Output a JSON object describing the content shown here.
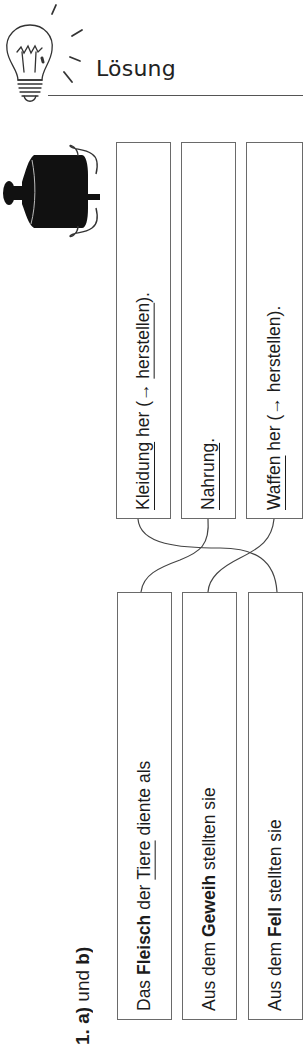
{
  "header": {
    "title": "Lösung",
    "icon": "lightbulb-icon"
  },
  "illustration": {
    "icon": "cooking-pot-icon"
  },
  "task": {
    "label_number": "1.",
    "label_a": "a)",
    "label_und": "und",
    "label_b": "b)"
  },
  "endings": [
    {
      "parts": [
        {
          "text": "Kleidung",
          "style": "underline"
        },
        {
          "text": " her (→ ",
          "style": "normal"
        },
        {
          "text": "herstellen",
          "style": "underline"
        },
        {
          "text": ").",
          "style": "normal"
        }
      ]
    },
    {
      "parts": [
        {
          "text": "Nahrung",
          "style": "underline"
        },
        {
          "text": ".",
          "style": "normal"
        }
      ]
    },
    {
      "parts": [
        {
          "text": "Waffen",
          "style": "underline"
        },
        {
          "text": " her (→ herstellen).",
          "style": "normal"
        }
      ]
    }
  ],
  "beginnings": [
    {
      "parts": [
        {
          "text": "Das ",
          "style": "normal"
        },
        {
          "text": "Fleisch",
          "style": "bold"
        },
        {
          "text": " der ",
          "style": "normal"
        },
        {
          "text": "Tiere",
          "style": "underline"
        },
        {
          "text": " diente als",
          "style": "normal"
        }
      ]
    },
    {
      "parts": [
        {
          "text": "Aus dem ",
          "style": "normal"
        },
        {
          "text": "Geweih",
          "style": "bold"
        },
        {
          "text": " stellten sie",
          "style": "normal"
        }
      ]
    },
    {
      "parts": [
        {
          "text": "Aus dem ",
          "style": "normal"
        },
        {
          "text": "Fell",
          "style": "bold"
        },
        {
          "text": " stellten sie",
          "style": "normal"
        }
      ]
    }
  ],
  "connections": [
    {
      "from": "beginnings.0",
      "to": "endings.1",
      "meaning": "Das Fleisch der Tiere diente als Nahrung."
    },
    {
      "from": "beginnings.1",
      "to": "endings.2",
      "meaning": "Aus dem Geweih stellten sie Waffen her."
    },
    {
      "from": "beginnings.2",
      "to": "endings.0",
      "meaning": "Aus dem Fell stellten sie Kleidung her."
    }
  ],
  "colors": {
    "ink": "#1c1c1c",
    "box_border": "#6a6a6a",
    "line": "#444444"
  }
}
